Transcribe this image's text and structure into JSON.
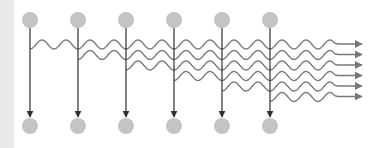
{
  "diagram": {
    "type": "sequential-emission",
    "colors": {
      "background": "#ffffff",
      "left_strip": "#e9e9e9",
      "node": "#c4c4c4",
      "vertical_line": "#2e2e2e",
      "wave": "#777777"
    },
    "columns_x": [
      30,
      78,
      126,
      174,
      222,
      270
    ],
    "top_nodes_y": 20,
    "bottom_nodes_y": 126,
    "node_radius": 8,
    "arrow_tip_y": 117,
    "waves": [
      {
        "start_x": 30,
        "start_y": 49,
        "end_y": 44
      },
      {
        "start_x": 78,
        "start_y": 59.5,
        "end_y": 54.5
      },
      {
        "start_x": 126,
        "start_y": 70,
        "end_y": 65
      },
      {
        "start_x": 174,
        "start_y": 80.5,
        "end_y": 75.5
      },
      {
        "start_x": 222,
        "start_y": 91,
        "end_y": 86
      },
      {
        "start_x": 270,
        "start_y": 101.5,
        "end_y": 96.5
      }
    ],
    "wave_amplitude": 4.5,
    "wave_period": 24,
    "wave_end_x": 330,
    "arrow_end_x": 362
  }
}
